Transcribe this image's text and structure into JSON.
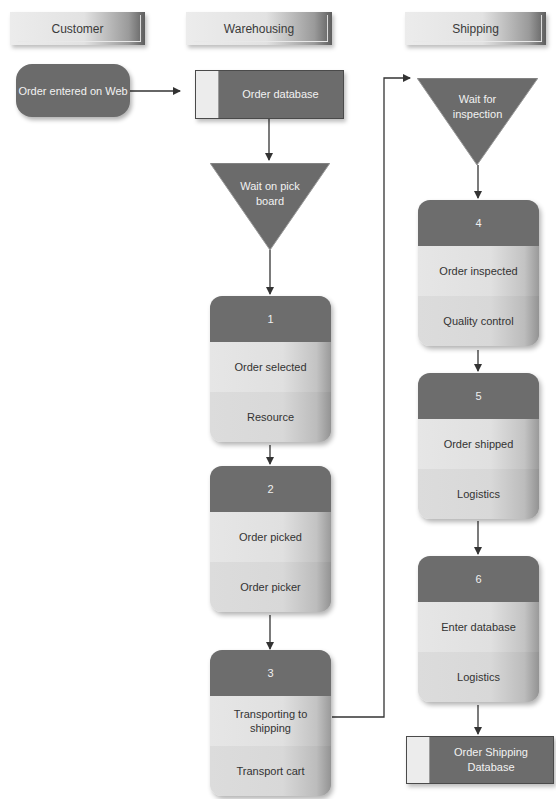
{
  "lanes": [
    {
      "label": "Customer"
    },
    {
      "label": "Warehousing"
    },
    {
      "label": "Shipping"
    }
  ],
  "start": {
    "label": "Order entered on Web"
  },
  "order_database": {
    "label": "Order database"
  },
  "wait_pick": {
    "line1": "Wait on pick",
    "line2": "board"
  },
  "wait_inspection": {
    "line1": "Wait for",
    "line2": "inspection"
  },
  "steps": [
    {
      "number": "1",
      "activity": "Order selected",
      "resource": "Resource"
    },
    {
      "number": "2",
      "activity": "Order picked",
      "resource": "Order picker"
    },
    {
      "number": "3",
      "activity_line1": "Transporting to",
      "activity_line2": "shipping",
      "resource": "Transport cart"
    },
    {
      "number": "4",
      "activity": "Order inspected",
      "resource": "Quality control"
    },
    {
      "number": "5",
      "activity": "Order shipped",
      "resource": "Logistics"
    },
    {
      "number": "6",
      "activity": "Enter database",
      "resource": "Logistics"
    }
  ],
  "shipping_database": {
    "line1": "Order Shipping",
    "line2": "Database"
  },
  "colors": {
    "shape_dark": "#6b6b6b",
    "shape_light": "#e2e2e2",
    "line": "#333333"
  }
}
